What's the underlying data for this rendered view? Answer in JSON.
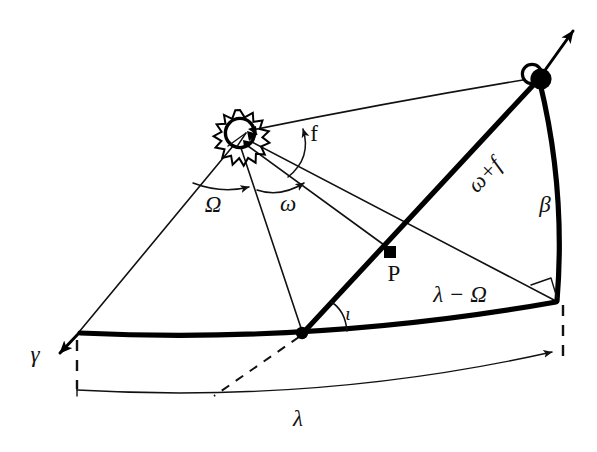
{
  "figure": {
    "background_color": "#ffffff",
    "line_color": "#111111",
    "width": 597,
    "height": 452
  },
  "labels": {
    "omega_cap": "Ω",
    "omega_small": "ω",
    "true_anomaly": "f",
    "arg_latitude": "ω+f",
    "inclination": "ι",
    "latitude": "β",
    "longitude": "λ",
    "lon_minus_node": "λ − Ω",
    "aries": "γ",
    "point_p": "P"
  },
  "nodes": [
    {
      "name": "sun",
      "symbol": "sun-symbol",
      "x": 240,
      "y": 133
    },
    {
      "name": "ascending-node",
      "symbol": "filled-dot",
      "x": 302,
      "y": 333
    },
    {
      "name": "body-position",
      "symbol": "filled-dot-with-ring",
      "x": 540,
      "y": 78
    },
    {
      "name": "perihelion-point-p",
      "symbol": "filled-square",
      "x": 390,
      "y": 252
    },
    {
      "name": "foot-of-perpendicular",
      "symbol": "vertex",
      "x": 556,
      "y": 301
    },
    {
      "name": "vernal-equinox-point",
      "symbol": "vertex",
      "x": 78,
      "y": 333
    }
  ],
  "angles": [
    {
      "name": "Ω",
      "meaning": "longitude-of-ascending-node",
      "label_x": 223,
      "label_y": 206
    },
    {
      "name": "ω",
      "meaning": "argument-of-perihelion",
      "label_x": 288,
      "label_y": 207
    },
    {
      "name": "f",
      "meaning": "true-anomaly",
      "label_x": 311,
      "label_y": 140
    },
    {
      "name": "ι",
      "meaning": "inclination",
      "label_x": 345,
      "label_y": 317
    },
    {
      "name": "β",
      "meaning": "ecliptic-latitude",
      "label_x": 541,
      "label_y": 207
    },
    {
      "name": "λ",
      "meaning": "ecliptic-longitude",
      "label_x": 298,
      "label_y": 424
    },
    {
      "name": "ω+f",
      "meaning": "argument-of-latitude",
      "label_x": 490,
      "label_y": 178
    },
    {
      "name": "λ − Ω",
      "meaning": "longitude-minus-node",
      "label_x": 433,
      "label_y": 300
    }
  ],
  "markers": {
    "right_angle": {
      "name": "right-angle-marker",
      "x": 556,
      "y": 301
    },
    "aries_arrow": {
      "name": "vernal-equinox-arrow",
      "tip_x": 52,
      "tip_y": 357
    },
    "orbit_arrow": {
      "name": "orbit-direction-arrow",
      "tip_x": 578,
      "tip_y": 25
    }
  }
}
